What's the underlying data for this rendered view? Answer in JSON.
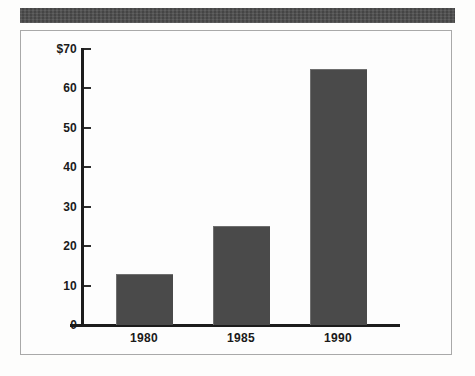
{
  "page": {
    "background_color": "#fdfdfc",
    "header_band_color": "#4d4d4d",
    "frame_border_color": "#a9a9a9"
  },
  "chart_data": {
    "type": "bar",
    "title": "",
    "subtitle": "",
    "xlabel": "",
    "ylabel": "",
    "categories": [
      "1980",
      "1985",
      "1990"
    ],
    "values": [
      13,
      25,
      65
    ],
    "ylim": [
      0,
      70
    ],
    "ytick_values": [
      0,
      10,
      20,
      30,
      40,
      50,
      60,
      70
    ],
    "ytick_labels": [
      "0",
      "10",
      "20",
      "30",
      "40",
      "50",
      "60",
      "$70"
    ],
    "grid": false,
    "legend": null,
    "legend_position": "none",
    "bar_color": "#4a4a4a",
    "axis_color": "#1c1c1c",
    "annotations": []
  }
}
